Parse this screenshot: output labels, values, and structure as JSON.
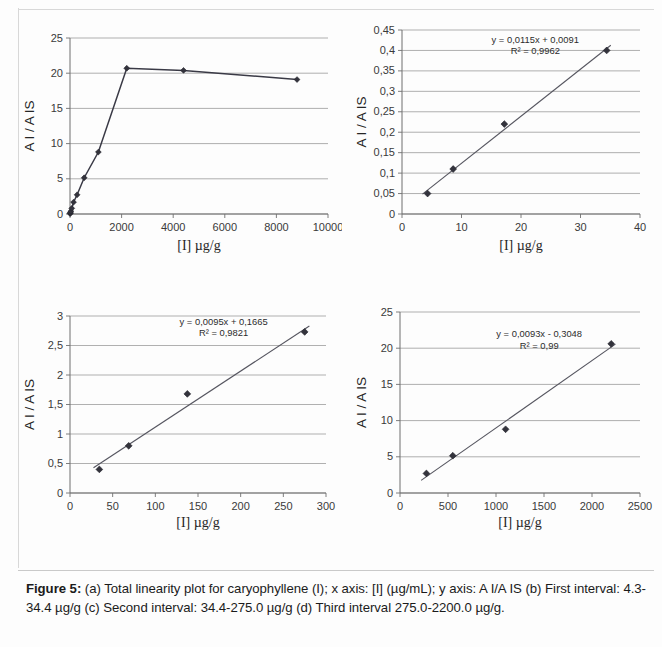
{
  "figure": {
    "caption_label": "Figure 5:",
    "caption_text": " (a) Total linearity plot for caryophyllene (I); x axis: [I] (µg/mL); y axis: A I/A IS (b) First interval: 4.3-34.4 µg/g (c) Second interval: 34.4-275.0 µg/g (d) Third interval 275.0-2200.0 µg/g."
  },
  "chart_data": [
    {
      "id": "a",
      "type": "line",
      "title": "",
      "xlabel": "[I] µg/g",
      "ylabel": "A I / A IS",
      "xlim": [
        0,
        10000
      ],
      "ylim": [
        0,
        25
      ],
      "xticks": [
        0,
        2000,
        4000,
        6000,
        8000,
        10000
      ],
      "yticks": [
        0,
        5,
        10,
        15,
        20,
        25
      ],
      "xticklabels": [
        "0",
        "2000",
        "4000",
        "6000",
        "8000",
        "10000"
      ],
      "yticklabels": [
        "0",
        "5",
        "10",
        "15",
        "20",
        "25"
      ],
      "grid": true,
      "legend": "none",
      "markers": "diamond",
      "x": [
        4.3,
        8.6,
        17.2,
        34.4,
        68.8,
        137.5,
        275,
        550,
        1100,
        2200,
        4400,
        8800
      ],
      "y": [
        0.05,
        0.11,
        0.22,
        0.4,
        0.8,
        1.68,
        2.73,
        5.15,
        8.8,
        20.7,
        20.4,
        19.1
      ]
    },
    {
      "id": "b",
      "type": "scatter",
      "title": "",
      "xlabel": "[I] µg/g",
      "ylabel": "A I / A IS",
      "xlim": [
        0,
        40
      ],
      "ylim": [
        0,
        0.45
      ],
      "xticks": [
        0,
        10,
        20,
        30,
        40
      ],
      "yticks": [
        0,
        0.05,
        0.1,
        0.15,
        0.2,
        0.25,
        0.3,
        0.35,
        0.4,
        0.45
      ],
      "xticklabels": [
        "0",
        "10",
        "20",
        "30",
        "40"
      ],
      "yticklabels": [
        "0",
        "0,05",
        "0,1",
        "0,15",
        "0,2",
        "0,25",
        "0,3",
        "0,35",
        "0,4",
        "0,45"
      ],
      "grid": true,
      "legend": "none",
      "markers": "diamond",
      "x": [
        4.3,
        8.6,
        17.2,
        34.4
      ],
      "y": [
        0.05,
        0.11,
        0.22,
        0.4
      ],
      "equation": "y = 0,0115x + 0,0091",
      "r2": "R² = 0,9962",
      "fit_slope": 0.0115,
      "fit_intercept": 0.0091
    },
    {
      "id": "c",
      "type": "scatter",
      "title": "",
      "xlabel": "[I] µg/g",
      "ylabel": "A I / A IS",
      "xlim": [
        0,
        300
      ],
      "ylim": [
        0,
        3
      ],
      "xticks": [
        0,
        50,
        100,
        150,
        200,
        250,
        300
      ],
      "yticks": [
        0,
        0.5,
        1,
        1.5,
        2,
        2.5,
        3
      ],
      "xticklabels": [
        "0",
        "50",
        "100",
        "150",
        "200",
        "250",
        "300"
      ],
      "yticklabels": [
        "0",
        "0,5",
        "1",
        "1,5",
        "2",
        "2,5",
        "3"
      ],
      "grid": true,
      "legend": "none",
      "markers": "diamond",
      "x": [
        34.4,
        68.8,
        137.5,
        275
      ],
      "y": [
        0.4,
        0.8,
        1.68,
        2.73
      ],
      "equation": "y = 0,0095x + 0,1665",
      "r2": "R² = 0,9821",
      "fit_slope": 0.0095,
      "fit_intercept": 0.1665
    },
    {
      "id": "d",
      "type": "scatter",
      "title": "",
      "xlabel": "[I] µg/g",
      "ylabel": "A I / A IS",
      "xlim": [
        0,
        2500
      ],
      "ylim": [
        0,
        25
      ],
      "xticks": [
        0,
        500,
        1000,
        1500,
        2000,
        2500
      ],
      "yticks": [
        0,
        5,
        10,
        15,
        20,
        25
      ],
      "xticklabels": [
        "0",
        "500",
        "1000",
        "1500",
        "2000",
        "2500"
      ],
      "yticklabels": [
        "0",
        "5",
        "10",
        "15",
        "20",
        "25"
      ],
      "grid": true,
      "legend": "none",
      "markers": "diamond",
      "x": [
        275,
        550,
        1100,
        2200
      ],
      "y": [
        2.7,
        5.15,
        8.8,
        20.6
      ],
      "equation": "y = 0,0093x - 0,3048",
      "r2": "R² = 0,99",
      "fit_slope": 0.0093,
      "fit_intercept": -0.3048
    }
  ],
  "colors": {
    "marker": "#33333c",
    "line": "#3a3a46",
    "grid": "#8e8e8e",
    "axis": "#6f6f6f",
    "text": "#262626",
    "background": "#fdfdfd"
  }
}
